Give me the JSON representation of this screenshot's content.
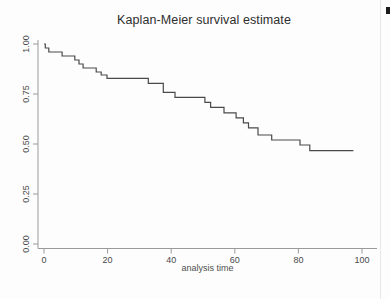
{
  "page": {
    "background_color": "#fdfdfd"
  },
  "chart_data": {
    "type": "line",
    "subtype": "kaplan-meier-step",
    "title": "Kaplan-Meier survival estimate",
    "xlabel": "analysis time",
    "ylabel": "",
    "x_ticks": [
      0,
      20,
      40,
      60,
      80,
      100
    ],
    "y_tick_labels": [
      "0.00",
      "0.25",
      "0.50",
      "0.75",
      "1.00"
    ],
    "xlim": [
      0,
      100
    ],
    "ylim": [
      0,
      1
    ],
    "grid": false,
    "legend": "none",
    "line_color": "#4a4a4a",
    "axis_color": "#9a9a9a",
    "label_color": "#4a4a4a",
    "series": [
      {
        "name": "survival",
        "start": [
          0,
          1.0
        ],
        "drops": [
          [
            0.4,
            0.98
          ],
          [
            1.5,
            0.96
          ],
          [
            5.7,
            0.94
          ],
          [
            9.7,
            0.92
          ],
          [
            11.0,
            0.9
          ],
          [
            12.3,
            0.88
          ],
          [
            16.4,
            0.86
          ],
          [
            18.0,
            0.845
          ],
          [
            19.8,
            0.828
          ],
          [
            32.8,
            0.803
          ],
          [
            37.5,
            0.758
          ],
          [
            41.2,
            0.733
          ],
          [
            50.6,
            0.708
          ],
          [
            52.4,
            0.683
          ],
          [
            56.6,
            0.656
          ],
          [
            60.4,
            0.631
          ],
          [
            62.7,
            0.606
          ],
          [
            64.3,
            0.581
          ],
          [
            67.3,
            0.545
          ],
          [
            71.6,
            0.52
          ],
          [
            80.5,
            0.495
          ],
          [
            83.6,
            0.467
          ]
        ],
        "end_time": 97.3,
        "final_survival": 0.467
      }
    ]
  }
}
